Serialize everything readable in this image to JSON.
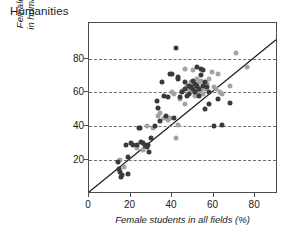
{
  "chart_data": {
    "type": "scatter",
    "title": "Humanities",
    "xlabel": "Female students in all fields (%)",
    "ylabel_line1": "Female students",
    "ylabel_line2": "in humanities (%)",
    "xlim": [
      0,
      91
    ],
    "ylim": [
      0,
      101
    ],
    "xticks": [
      0,
      20,
      40,
      60,
      80
    ],
    "yticks": [
      20,
      40,
      60,
      80
    ],
    "grid": "horizontal-dashed",
    "legend": "none",
    "reference_line": {
      "name": "identity-line",
      "description": "y = x diagonal",
      "from": [
        0,
        0
      ],
      "to": [
        91,
        91
      ]
    },
    "colors": {
      "dark": "#3a3a3a",
      "light": "#a3a3a3",
      "axis": "#4d4d4d",
      "grid": "#6f6f6f",
      "text": "#1a1a1a"
    },
    "series": [
      {
        "name": "dark-markers",
        "color": "#3a3a3a",
        "points": [
          [
            14,
            19
          ],
          [
            14.5,
            15
          ],
          [
            15,
            13
          ],
          [
            15.5,
            10
          ],
          [
            16,
            11
          ],
          [
            19,
            12
          ],
          [
            19,
            22
          ],
          [
            18,
            29
          ],
          [
            20,
            30
          ],
          [
            21,
            29
          ],
          [
            23,
            29
          ],
          [
            24,
            39
          ],
          [
            24.5,
            39
          ],
          [
            25,
            31
          ],
          [
            26,
            30
          ],
          [
            27,
            29
          ],
          [
            28,
            28
          ],
          [
            28.5,
            29
          ],
          [
            29,
            25
          ],
          [
            30,
            33
          ],
          [
            32,
            40
          ],
          [
            32.5,
            55
          ],
          [
            33,
            51
          ],
          [
            34,
            43
          ],
          [
            35,
            66
          ],
          [
            36,
            58
          ],
          [
            37,
            46
          ],
          [
            38,
            57
          ],
          [
            39,
            71
          ],
          [
            40,
            71
          ],
          [
            41,
            45
          ],
          [
            42,
            86
          ],
          [
            43,
            69
          ],
          [
            43,
            68
          ],
          [
            44,
            57
          ],
          [
            45,
            60
          ],
          [
            46,
            62
          ],
          [
            46,
            66
          ],
          [
            47,
            58
          ],
          [
            48,
            64
          ],
          [
            48,
            59
          ],
          [
            49,
            63
          ],
          [
            50,
            62
          ],
          [
            50,
            67
          ],
          [
            51,
            65
          ],
          [
            51,
            60
          ],
          [
            52,
            64
          ],
          [
            52,
            75
          ],
          [
            53,
            62
          ],
          [
            53,
            58
          ],
          [
            54,
            70
          ],
          [
            54,
            74
          ],
          [
            55,
            73
          ],
          [
            55,
            64
          ],
          [
            56,
            66
          ],
          [
            56,
            50
          ],
          [
            57,
            63
          ],
          [
            58,
            60
          ],
          [
            58,
            53
          ],
          [
            60,
            40
          ],
          [
            62,
            56
          ],
          [
            64,
            41
          ],
          [
            68,
            54
          ]
        ]
      },
      {
        "name": "light-markers",
        "color": "#a3a3a3",
        "points": [
          [
            15,
            20
          ],
          [
            17,
            16
          ],
          [
            23,
            27
          ],
          [
            26,
            26
          ],
          [
            28,
            40
          ],
          [
            31,
            39
          ],
          [
            33,
            46
          ],
          [
            34,
            48
          ],
          [
            36,
            45
          ],
          [
            37,
            45
          ],
          [
            38,
            44
          ],
          [
            39,
            45
          ],
          [
            40,
            60
          ],
          [
            41,
            59
          ],
          [
            42,
            33
          ],
          [
            43,
            41
          ],
          [
            44,
            56
          ],
          [
            45,
            61
          ],
          [
            46,
            53
          ],
          [
            46,
            74
          ],
          [
            47,
            64
          ],
          [
            48,
            62
          ],
          [
            49,
            60
          ],
          [
            49,
            66
          ],
          [
            50,
            73
          ],
          [
            50,
            65
          ],
          [
            51,
            61
          ],
          [
            51,
            58
          ],
          [
            52,
            68
          ],
          [
            52,
            63
          ],
          [
            53,
            60
          ],
          [
            53,
            66
          ],
          [
            54,
            67
          ],
          [
            54,
            61
          ],
          [
            55,
            64
          ],
          [
            55,
            59
          ],
          [
            56,
            62
          ],
          [
            57,
            65
          ],
          [
            58,
            68
          ],
          [
            59,
            72
          ],
          [
            60,
            63
          ],
          [
            61,
            62
          ],
          [
            62,
            71
          ],
          [
            63,
            60
          ],
          [
            64,
            59
          ],
          [
            68,
            64
          ],
          [
            71,
            83
          ],
          [
            76,
            75
          ]
        ]
      }
    ]
  }
}
